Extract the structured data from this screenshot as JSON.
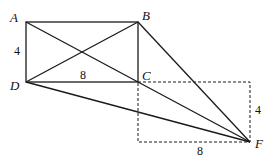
{
  "diagram": {
    "points": {
      "A": {
        "label": "A",
        "x": 26,
        "y": 22
      },
      "B": {
        "label": "B",
        "x": 138,
        "y": 22
      },
      "C": {
        "label": "C",
        "x": 138,
        "y": 82
      },
      "D": {
        "label": "D",
        "x": 26,
        "y": 82
      },
      "F": {
        "label": "F",
        "x": 250,
        "y": 142
      }
    },
    "measurements": {
      "AD": "4",
      "DC": "8",
      "dashed_height": "4",
      "dashed_width": "8"
    },
    "colors": {
      "stroke": "#1a1a1a",
      "background": "#ffffff"
    }
  }
}
